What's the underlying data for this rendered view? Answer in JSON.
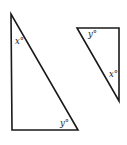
{
  "figure": {
    "triangles": [
      {
        "id": "large",
        "vertices": [
          [
            11,
            14
          ],
          [
            12,
            130
          ],
          [
            78,
            130
          ]
        ],
        "labels": [
          {
            "text": "x°",
            "pos": [
              15,
              44
            ],
            "angle_at": "top vertex"
          },
          {
            "text": "y°",
            "pos": [
              60,
              126
            ],
            "angle_at": "bottom-right vertex"
          }
        ]
      },
      {
        "id": "small",
        "vertices": [
          [
            77,
            28
          ],
          [
            119,
            28
          ],
          [
            119,
            101
          ]
        ],
        "labels": [
          {
            "text": "y°",
            "pos": [
              88,
              37
            ],
            "angle_at": "top-left vertex"
          },
          {
            "text": "x°",
            "pos": [
              109,
              77
            ],
            "angle_at": "bottom vertex"
          }
        ]
      }
    ],
    "stroke_color": "#1a1a1a",
    "background": "#ffffff"
  }
}
